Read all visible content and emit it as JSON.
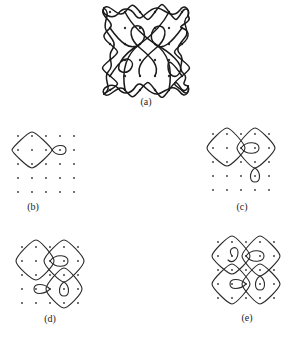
{
  "figure": {
    "type": "kolam dot-grid diagrams",
    "panels": [
      {
        "id": "a",
        "label": "(a)",
        "grid": "6x6",
        "description": "Complete kolam: continuous curve looping around all 36 dots"
      },
      {
        "id": "b",
        "label": "(b)",
        "grid": "5x5",
        "description": "Step 1: single diamond loop around one dot region with a small teardrop loop"
      },
      {
        "id": "c",
        "label": "(c)",
        "grid": "5x5",
        "description": "Step 2: second diamond loop added, intersecting the first, with a lower teardrop"
      },
      {
        "id": "d",
        "label": "(d)",
        "grid": "5x5",
        "description": "Step 3: third diamond loop added with additional teardrop loops"
      },
      {
        "id": "e",
        "label": "(e)",
        "grid": "5x5",
        "description": "Step 4: four interlocking diamond loops with inner teardrops"
      }
    ]
  },
  "colors": {
    "stroke": "#2a2a2a",
    "dot": "#333333",
    "background": "#ffffff"
  }
}
